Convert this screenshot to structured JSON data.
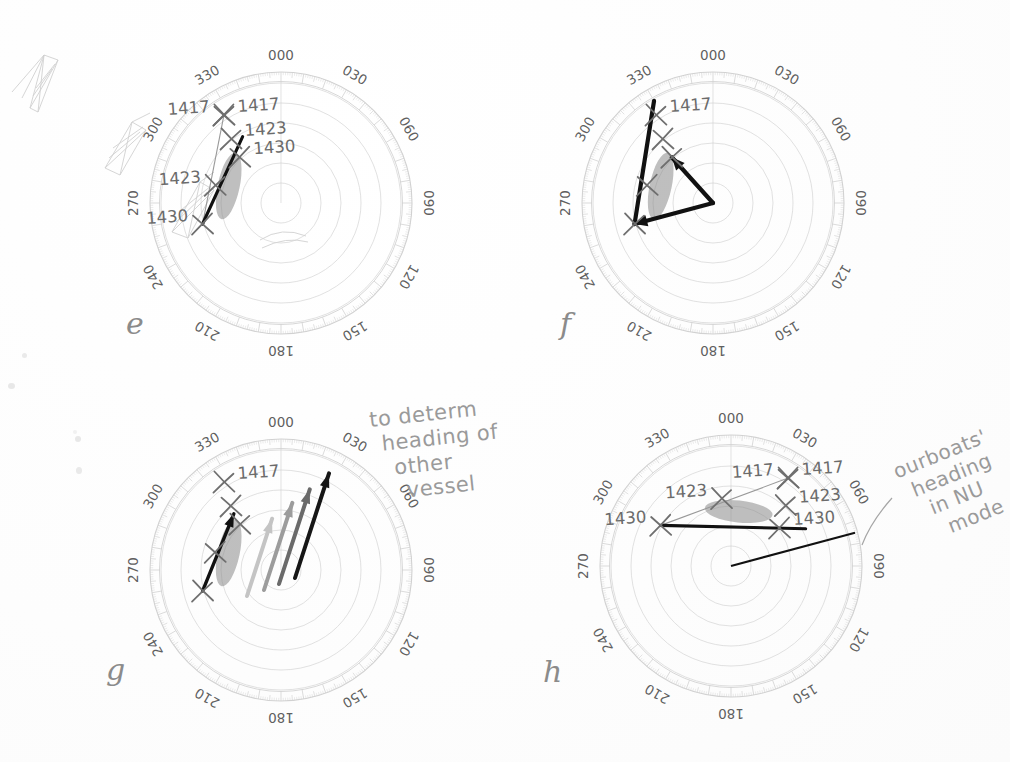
{
  "document": {
    "kind": "scanned-notebook-page",
    "title": "Radar relative-motion polar plots",
    "background_color": "#ffffff",
    "ink_color": "#6f6f6f",
    "dark_ink_color": "#111111",
    "grid_color": "#d2d2d2",
    "blob_color": "#8a8a8a"
  },
  "panels": [
    {
      "id": "e",
      "letter": "e",
      "letter_pos": {
        "x": 132,
        "y": 312
      },
      "center": {
        "x": 281,
        "y": 203
      },
      "radius": 131,
      "bearing_labels": [
        "000",
        "030",
        "060",
        "090",
        "120",
        "150",
        "180",
        "210",
        "240",
        "270",
        "300",
        "330"
      ],
      "ring_count": 6,
      "plot_marks": [
        {
          "label": "1417",
          "label_side": "left",
          "r": 0.8,
          "theta": 327
        },
        {
          "label": "1417",
          "label_side": "right",
          "r": 0.8,
          "theta": 327
        },
        {
          "label": "1423",
          "label_side": "right",
          "r": 0.62,
          "theta": 322
        },
        {
          "label": "1430",
          "label_side": "right",
          "r": 0.47,
          "theta": 318
        },
        {
          "label": "1423",
          "label_side": "left",
          "r": 0.52,
          "theta": 285
        },
        {
          "label": "1430",
          "label_side": "left",
          "r": 0.62,
          "theta": 255
        }
      ],
      "heading_line": {
        "from_theta": 327,
        "from_r": 0.8,
        "to_theta": 255,
        "to_r": 0.62,
        "style": "thin-grey"
      },
      "relative_track": {
        "from_theta": 255,
        "from_r": 0.62,
        "to_theta": 318,
        "to_r": 0.52,
        "style": "thick-black"
      },
      "blob": {
        "theta": 288,
        "r": 0.42,
        "angle_deg": 12,
        "w": 11,
        "h": 34
      }
    },
    {
      "id": "f",
      "letter": "f",
      "letter_pos": {
        "x": 566,
        "y": 312
      },
      "center": {
        "x": 713,
        "y": 203
      },
      "radius": 131,
      "bearing_labels": [
        "000",
        "030",
        "060",
        "090",
        "120",
        "150",
        "180",
        "210",
        "240",
        "270",
        "300",
        "330"
      ],
      "ring_count": 6,
      "plot_marks": [
        {
          "label": "1417",
          "label_side": "right",
          "r": 0.8,
          "theta": 327
        },
        {
          "label": "",
          "label_side": "right",
          "r": 0.62,
          "theta": 322
        },
        {
          "label": "",
          "label_side": "right",
          "r": 0.47,
          "theta": 318
        },
        {
          "label": "",
          "label_side": "left",
          "r": 0.52,
          "theta": 285
        },
        {
          "label": "",
          "label_side": "left",
          "r": 0.62,
          "theta": 255
        }
      ],
      "vectors": [
        {
          "name": "relative-motion-vector",
          "from": "centre",
          "to_theta": 318,
          "to_r": 0.47,
          "arrow": true
        },
        {
          "name": "own-ship-vector",
          "from": "centre",
          "to_theta": 255,
          "to_r": 0.62,
          "arrow": true
        },
        {
          "name": "other-vessel-vector",
          "from_theta": 255,
          "from_r": 0.62,
          "to_theta": 330,
          "to_r": 0.9,
          "arrow": false
        }
      ],
      "blob": {
        "theta": 288,
        "r": 0.42,
        "angle_deg": 12,
        "w": 11,
        "h": 34
      }
    },
    {
      "id": "g",
      "letter": "g",
      "letter_pos": {
        "x": 112,
        "y": 660
      },
      "center": {
        "x": 281,
        "y": 570
      },
      "radius": 131,
      "bearing_labels": [
        "000",
        "030",
        "060",
        "090",
        "120",
        "150",
        "180",
        "210",
        "240",
        "270",
        "300",
        "330"
      ],
      "ring_count": 6,
      "plot_marks": [
        {
          "label": "1417",
          "label_side": "right",
          "r": 0.8,
          "theta": 327
        },
        {
          "label": "",
          "label_side": "right",
          "r": 0.62,
          "theta": 322
        },
        {
          "label": "",
          "label_side": "right",
          "r": 0.47,
          "theta": 318
        },
        {
          "label": "",
          "label_side": "left",
          "r": 0.52,
          "theta": 285
        },
        {
          "label": "",
          "label_side": "left",
          "r": 0.62,
          "theta": 255
        }
      ],
      "heading_arrows": [
        {
          "name": "heading-arrow-1",
          "shade": "#c4c4c4",
          "dx": -34,
          "dy": 26,
          "len": 0.62,
          "theta": 18
        },
        {
          "name": "heading-arrow-2",
          "shade": "#9c9c9c",
          "dx": -17,
          "dy": 20,
          "len": 0.7,
          "theta": 18
        },
        {
          "name": "heading-arrow-3",
          "shade": "#6a6a6a",
          "dx": -2,
          "dy": 14,
          "len": 0.76,
          "theta": 18
        },
        {
          "name": "heading-arrow-4",
          "shade": "#161616",
          "dx": 14,
          "dy": 8,
          "len": 0.84,
          "theta": 18
        }
      ],
      "track_arrow": {
        "from_theta": 255,
        "from_r": 0.62,
        "to_theta": 320,
        "to_r": 0.56,
        "arrow": true
      },
      "blob": {
        "theta": 288,
        "r": 0.42,
        "angle_deg": 12,
        "w": 11,
        "h": 34
      },
      "annotation": {
        "lines": [
          "to determ",
          "heading of",
          "other",
          "vessel"
        ],
        "x": 368,
        "y": 412,
        "rotation_deg": -6
      }
    },
    {
      "id": "h",
      "letter": "h",
      "letter_pos": {
        "x": 549,
        "y": 662
      },
      "center": {
        "x": 731,
        "y": 566
      },
      "radius": 131,
      "bearing_labels": [
        "000",
        "030",
        "060",
        "090",
        "120",
        "150",
        "180",
        "210",
        "240",
        "270",
        "300",
        "330"
      ],
      "ring_count": 6,
      "plot_marks": [
        {
          "label": "1417",
          "label_side": "left",
          "r": 0.8,
          "theta": 33
        },
        {
          "label": "1417",
          "label_side": "right",
          "r": 0.8,
          "theta": 33
        },
        {
          "label": "1423",
          "label_side": "right",
          "r": 0.62,
          "theta": 42
        },
        {
          "label": "1430",
          "label_side": "right",
          "r": 0.47,
          "theta": 52
        },
        {
          "label": "1423",
          "label_side": "left",
          "r": 0.52,
          "theta": 352
        },
        {
          "label": "1430",
          "label_side": "left",
          "r": 0.62,
          "theta": 300
        }
      ],
      "heading_line": {
        "from_theta": 33,
        "from_r": 0.8,
        "to_theta": 300,
        "to_r": 0.62,
        "style": "thin-grey"
      },
      "relative_track": {
        "from_theta": 300,
        "from_r": 0.62,
        "to_theta": 52,
        "to_r": 0.47,
        "style": "thick-black"
      },
      "own_heading_line": {
        "from": "centre",
        "to_theta": 75,
        "to_r": 0.98
      },
      "blob": {
        "theta": 8,
        "r": 0.42,
        "angle_deg": 96,
        "w": 11,
        "h": 34
      },
      "annotation": {
        "lines": [
          "ourboats'",
          "heading",
          "in NU",
          "mode"
        ],
        "x": 890,
        "y": 462,
        "rotation_deg": -22,
        "leader_from": {
          "x": 862,
          "y": 545
        },
        "leader_to": {
          "x": 892,
          "y": 498
        }
      }
    }
  ],
  "sketch_artifacts": {
    "towers": {
      "x": 5,
      "y": 18,
      "count": 3,
      "description": "faint pencil tower sketches"
    },
    "specks": [
      {
        "x": 22,
        "y": 353,
        "d": 5
      },
      {
        "x": 8,
        "y": 383,
        "d": 6
      },
      {
        "x": 76,
        "y": 436,
        "d": 5
      },
      {
        "x": 76,
        "y": 467,
        "d": 6
      },
      {
        "x": 73,
        "y": 430,
        "d": 3
      }
    ]
  }
}
